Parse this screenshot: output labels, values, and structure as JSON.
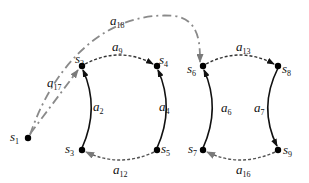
{
  "diagram": {
    "nodes": [
      {
        "id": "s1",
        "label": "s",
        "sub": "1",
        "x": 28,
        "y": 138
      },
      {
        "id": "s2",
        "label": "s",
        "sub": "2",
        "x": 82,
        "y": 66
      },
      {
        "id": "s3",
        "label": "s",
        "sub": "3",
        "x": 82,
        "y": 150
      },
      {
        "id": "s4",
        "label": "s",
        "sub": "4",
        "x": 157,
        "y": 66
      },
      {
        "id": "s5",
        "label": "s",
        "sub": "5",
        "x": 157,
        "y": 150
      },
      {
        "id": "s6",
        "label": "s",
        "sub": "6",
        "x": 203,
        "y": 66
      },
      {
        "id": "s7",
        "label": "s",
        "sub": "7",
        "x": 203,
        "y": 150
      },
      {
        "id": "s8",
        "label": "s",
        "sub": "8",
        "x": 278,
        "y": 66
      },
      {
        "id": "s9",
        "label": "s",
        "sub": "9",
        "x": 278,
        "y": 150
      }
    ],
    "edges": [
      {
        "id": "a2",
        "label": "a",
        "sub": "2",
        "from": "s3",
        "to": "s2",
        "style": "solid"
      },
      {
        "id": "a4",
        "label": "a",
        "sub": "4",
        "from": "s5",
        "to": "s4",
        "style": "solid"
      },
      {
        "id": "a6",
        "label": "a",
        "sub": "6",
        "from": "s7",
        "to": "s6",
        "style": "solid"
      },
      {
        "id": "a7",
        "label": "a",
        "sub": "7",
        "from": "s8",
        "to": "s9",
        "style": "solid"
      },
      {
        "id": "a9",
        "label": "a",
        "sub": "9",
        "from": "s2",
        "to": "s4",
        "style": "dotted"
      },
      {
        "id": "a13",
        "label": "a",
        "sub": "13",
        "from": "s6",
        "to": "s8",
        "style": "dotted"
      },
      {
        "id": "a12",
        "label": "a",
        "sub": "12",
        "from": "s5",
        "to": "s3",
        "style": "dotted"
      },
      {
        "id": "a16",
        "label": "a",
        "sub": "16",
        "from": "s9",
        "to": "s7",
        "style": "dotted"
      },
      {
        "id": "a17",
        "label": "a",
        "sub": "17",
        "from": "s1",
        "to": "s2",
        "style": "dash-dot"
      },
      {
        "id": "a18",
        "label": "a",
        "sub": "18",
        "from": "s1",
        "to": "s6",
        "style": "dash-dot"
      }
    ],
    "colors": {
      "solid": "#111111",
      "dotted": "#333333",
      "dashdot": "#8a8a8a",
      "arrow_gray": "#7a7a7a"
    }
  }
}
